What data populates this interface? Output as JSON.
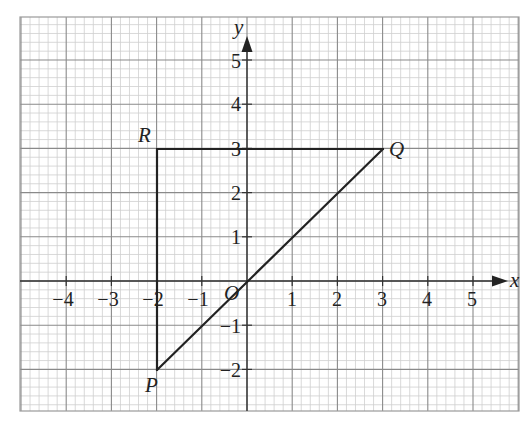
{
  "chart_data": {
    "type": "line",
    "title": "",
    "xlabel": "x",
    "ylabel": "y",
    "xlim": [
      -5,
      6
    ],
    "ylim": [
      -3,
      6
    ],
    "grid": true,
    "x_ticks": [
      -4,
      -3,
      -2,
      -1,
      1,
      2,
      3,
      4,
      5
    ],
    "y_ticks": [
      -2,
      -1,
      1,
      2,
      3,
      4,
      5
    ],
    "origin_label": "O",
    "points": [
      {
        "label": "P",
        "x": -2,
        "y": -2
      },
      {
        "label": "Q",
        "x": 3,
        "y": 3
      },
      {
        "label": "R",
        "x": -2,
        "y": 3
      }
    ],
    "segments": [
      {
        "from": "P",
        "to": "Q"
      },
      {
        "from": "Q",
        "to": "R"
      },
      {
        "from": "R",
        "to": "P"
      }
    ]
  },
  "labels": {
    "x_axis": "x",
    "y_axis": "y",
    "origin": "O",
    "P": "P",
    "Q": "Q",
    "R": "R",
    "xt": {
      "m4": "−4",
      "m3": "−3",
      "m2": "−2",
      "m1": "−1",
      "p1": "1",
      "p2": "2",
      "p3": "3",
      "p4": "4",
      "p5": "5"
    },
    "yt": {
      "m2": "−2",
      "m1": "−1",
      "p1": "1",
      "p2": "2",
      "p3": "3",
      "p4": "4",
      "p5": "5"
    }
  },
  "colors": {
    "minor_grid": "#cfcfcf",
    "major_grid": "#8a8a8a",
    "axis": "#333333",
    "shape": "#222222"
  }
}
